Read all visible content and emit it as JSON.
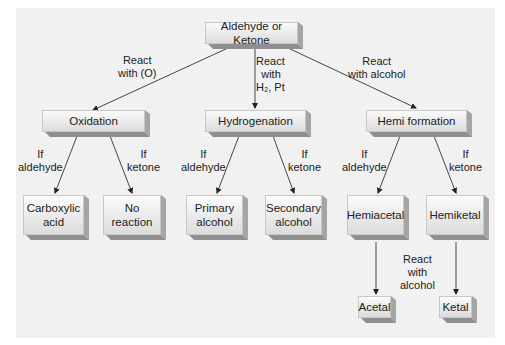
{
  "diagram": {
    "root": "Aldehyde or Ketone",
    "branches": [
      {
        "edge_label": [
          "React",
          "with (O)"
        ],
        "node": "Oxidation",
        "children": [
          {
            "edge_label": [
              "If",
              "aldehyde"
            ],
            "node": [
              "Carboxylic",
              "acid"
            ]
          },
          {
            "edge_label": [
              "If",
              "ketone"
            ],
            "node": [
              "No",
              "reaction"
            ]
          }
        ]
      },
      {
        "edge_label": [
          "React",
          "with",
          "H₂, Pt"
        ],
        "node": "Hydrogenation",
        "children": [
          {
            "edge_label": [
              "If",
              "aldehyde"
            ],
            "node": [
              "Primary",
              "alcohol"
            ]
          },
          {
            "edge_label": [
              "If",
              "ketone"
            ],
            "node": [
              "Secondary",
              "alcohol"
            ]
          }
        ]
      },
      {
        "edge_label": [
          "React",
          "with alcohol"
        ],
        "node": "Hemi formation",
        "children": [
          {
            "edge_label": [
              "If",
              "aldehyde"
            ],
            "node": [
              "Hemiacetal"
            ],
            "next": "Acetal"
          },
          {
            "edge_label": [
              "If",
              "ketone"
            ],
            "node": [
              "Hemiketal"
            ],
            "next": "Ketal"
          }
        ]
      }
    ],
    "final_edge_label": [
      "React",
      "with",
      "alcohol"
    ]
  },
  "colors": {
    "panel": "#f1f1f1",
    "box_face": "#e8e8e8",
    "box_shadow": "#9a9a9a",
    "line": "#333333"
  }
}
